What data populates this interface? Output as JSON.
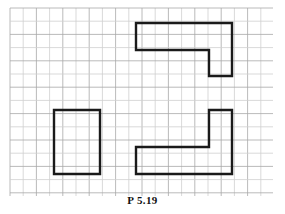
{
  "figure": {
    "caption": "P 5.19",
    "background_color": "#ffffff",
    "grid": {
      "line_color": "#a8a8a8",
      "minor_line_color": "#cfcfcf",
      "line_width": 0.8,
      "spacing_px": 13.2,
      "x_start": 10,
      "y_start": 8,
      "x_end": 273,
      "y_end": 196,
      "columns": 20,
      "rows": 14
    },
    "stroke": {
      "color": "#1a1a1a",
      "width": 2.4,
      "linejoin": "miter",
      "linecap": "square"
    },
    "shapes": [
      {
        "name": "top-right-z-shape",
        "description": "Horizontal bar with a vertical leg descending from its right end",
        "points": "136,23 232,23 232,76 209,76 209,50 136,50 136,23"
      },
      {
        "name": "bottom-left-rectangle",
        "description": "Plain upright rectangle",
        "points": "54,110 100,110 100,174 54,174 54,110"
      },
      {
        "name": "bottom-right-l-shape",
        "description": "Vertical leg on the right with a horizontal bar extending left along the bottom",
        "points": "209,110 232,110 232,174 136,174 136,147 209,147 209,110"
      }
    ]
  }
}
